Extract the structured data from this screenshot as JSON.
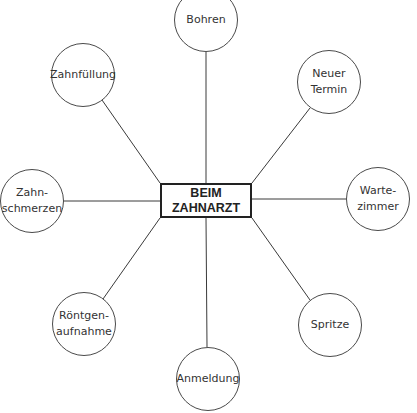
{
  "diagram": {
    "type": "mind-map",
    "center": {
      "label": "BEIM\nZAHNARZT"
    },
    "nodes": [
      {
        "id": "bohren",
        "label": "Bohren",
        "cx": 206,
        "cy": 20
      },
      {
        "id": "neuer-termin",
        "label": "Neuer\nTermin",
        "cx": 329,
        "cy": 82
      },
      {
        "id": "wartezimmer",
        "label": "Warte-\nzimmer",
        "cx": 378,
        "cy": 199
      },
      {
        "id": "spritze",
        "label": "Spritze",
        "cx": 330,
        "cy": 325
      },
      {
        "id": "anmeldung",
        "label": "Anmeldung",
        "cx": 208,
        "cy": 379
      },
      {
        "id": "roentgenaufnahme",
        "label": "Röntgen-\naufnahme",
        "cx": 84,
        "cy": 324
      },
      {
        "id": "zahnschmerzen",
        "label": "Zahn-\nschmerzen",
        "cx": 32,
        "cy": 201
      },
      {
        "id": "zahnfuellung",
        "label": "Zahnfüllung",
        "cx": 83,
        "cy": 75
      }
    ],
    "edges": [
      {
        "to": "bohren",
        "x1": 206,
        "y1": 183,
        "x2": 206,
        "y2": 52
      },
      {
        "to": "neuer-termin",
        "x1": 252,
        "y1": 183,
        "x2": 310,
        "y2": 108
      },
      {
        "to": "wartezimmer",
        "x1": 252,
        "y1": 199,
        "x2": 346,
        "y2": 199
      },
      {
        "to": "spritze",
        "x1": 252,
        "y1": 218,
        "x2": 310,
        "y2": 300
      },
      {
        "to": "anmeldung",
        "x1": 206,
        "y1": 218,
        "x2": 207,
        "y2": 347
      },
      {
        "to": "roentgenaufnahme",
        "x1": 160,
        "y1": 218,
        "x2": 103,
        "y2": 299
      },
      {
        "to": "zahnschmerzen",
        "x1": 160,
        "y1": 201,
        "x2": 63,
        "y2": 201
      },
      {
        "to": "zahnfuellung",
        "x1": 160,
        "y1": 183,
        "x2": 102,
        "y2": 100
      }
    ],
    "node_radius": 32,
    "colors": {
      "line": "#3a3a3a",
      "circle_border": "#4a4a4a",
      "box_border": "#222222",
      "text": "#333333"
    }
  }
}
